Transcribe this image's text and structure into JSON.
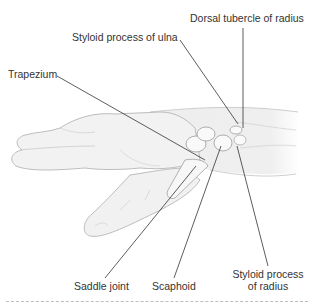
{
  "figure": {
    "labels": {
      "dorsal_tubercle": "Dorsal tubercle of radius",
      "styloid_ulna": "Styloid process of ulna",
      "trapezium": "Trapezium",
      "saddle_joint": "Saddle joint",
      "scaphoid": "Scaphoid",
      "styloid_radius_line1": "Styloid process",
      "styloid_radius_line2": "of radius"
    },
    "colors": {
      "background": "#ffffff",
      "skin_fill": "#f1f1f1",
      "skin_outline": "#b8b8b8",
      "bone_fill": "#fafafa",
      "bone_outline": "#9a9a9a",
      "leader_line": "#333333",
      "divider": "#bdbdbd"
    }
  }
}
